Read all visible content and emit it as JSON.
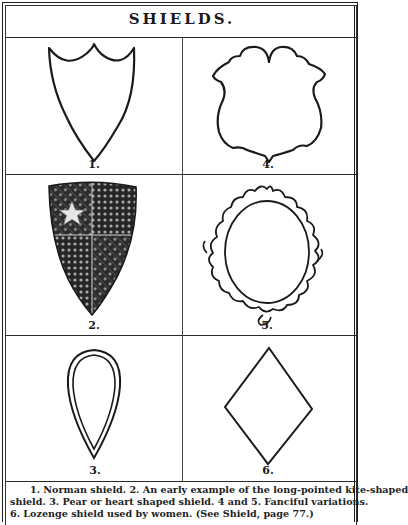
{
  "page": {
    "title": "SHIELDS.",
    "figures": [
      {
        "number": "1.",
        "name": "Norman shield",
        "shape": "norman-shield"
      },
      {
        "number": "2.",
        "name": "Long-pointed kite-shaped shield",
        "shape": "kite-shield-decorated"
      },
      {
        "number": "3.",
        "name": "Pear or heart shaped shield",
        "shape": "pear-shield"
      },
      {
        "number": "4.",
        "name": "Fanciful variation",
        "shape": "fanciful-shield"
      },
      {
        "number": "5.",
        "name": "Fanciful variation",
        "shape": "cartouche-shield"
      },
      {
        "number": "6.",
        "name": "Lozenge shield",
        "shape": "lozenge-shield"
      }
    ],
    "caption": {
      "line1": "1. Norman shield.   2. An early example of the long-pointed kite-shaped",
      "line2": "shield.   3. Pear or heart shaped shield.    4 and 5. Fanciful variations.",
      "line3": "6. Lozenge shield used by women.                    (See Shield, page 77.)"
    },
    "colors": {
      "ink": "#1a1a1a",
      "paper": "#ffffff"
    }
  }
}
